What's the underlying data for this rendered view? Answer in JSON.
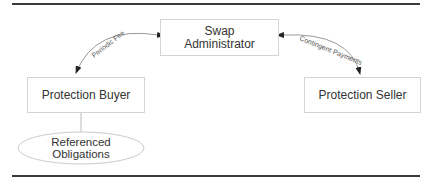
{
  "diagram": {
    "nodes": {
      "administrator": {
        "label_line1": "Swap",
        "label_line2": "Administrator"
      },
      "buyer": {
        "label": "Protection Buyer"
      },
      "seller": {
        "label": "Protection Seller"
      },
      "obligations": {
        "label_line1": "Referenced",
        "label_line2": "Obligations"
      }
    },
    "edges": {
      "periodic_fee": {
        "label": "Periodic Fee"
      },
      "contingent_payments": {
        "label": "Contingent Payments"
      }
    },
    "colors": {
      "rule": "#3a3a3a",
      "box_border": "#d4d4d4",
      "text": "#333333",
      "arrow": "#222222"
    }
  }
}
